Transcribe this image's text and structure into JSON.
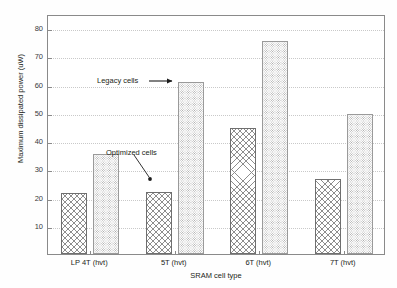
{
  "chart_data": {
    "type": "bar",
    "title": "",
    "xlabel": "SRAM cell type",
    "ylabel": "Maximum dissipated power (uW)",
    "categories": [
      "LP 4T (hvt)",
      "5T (hvt)",
      "6T (hvt)",
      "7T (hvt)"
    ],
    "series": [
      {
        "name": "Optimized cells",
        "values": [
          21.5,
          22.0,
          44.5,
          26.5
        ]
      },
      {
        "name": "Legacy cells",
        "values": [
          35.5,
          61.0,
          75.5,
          49.5
        ]
      }
    ],
    "yticks": [
      10,
      20,
      30,
      40,
      50,
      60,
      70,
      80
    ],
    "ylim": [
      0,
      85
    ],
    "grid": true,
    "legend_position": "none",
    "annotations": [
      {
        "text": "Legacy cells",
        "target_series": "Legacy cells",
        "target_category": "5T (hvt)"
      },
      {
        "text": "Optimized cells",
        "target_series": "Optimized cells",
        "target_category": "5T (hvt)"
      }
    ],
    "colors": {
      "axis": "#8a8a8a",
      "grid": "#c9c9c9",
      "text": "#231f20",
      "optimized_hatch": "#8d8d8d",
      "legacy_dots": "#a8a8a8",
      "background": "#ffffff"
    }
  }
}
